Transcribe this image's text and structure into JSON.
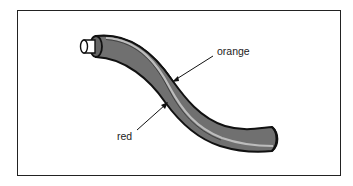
{
  "diagram": {
    "title": "",
    "labels": {
      "orange": "orange",
      "red": "red"
    },
    "colors": {
      "cable_fill": "#6e6e6e",
      "stripe": "#b8b8b8",
      "outline": "#111111",
      "border": "#222222"
    }
  }
}
